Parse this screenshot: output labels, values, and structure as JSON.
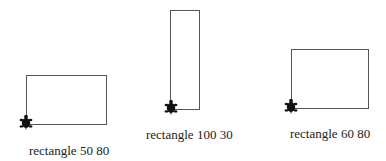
{
  "colors": {
    "line": "#555555",
    "turtle": "#111111",
    "text": "#222222",
    "background": "#ffffff"
  },
  "figures": [
    {
      "label": "rectangle 50 80",
      "height": 50,
      "width": 80,
      "rect": {
        "x": 26,
        "y": 75,
        "w": 80,
        "h": 49
      },
      "turtle": {
        "x": 26,
        "y": 124
      },
      "label_pos": {
        "x": 29,
        "y": 144
      }
    },
    {
      "label": "rectangle 100 30",
      "height": 100,
      "width": 30,
      "rect": {
        "x": 170,
        "y": 10,
        "w": 29,
        "h": 99
      },
      "turtle": {
        "x": 171,
        "y": 109
      },
      "label_pos": {
        "x": 146,
        "y": 128
      }
    },
    {
      "label": "rectangle 60 80",
      "height": 60,
      "width": 80,
      "rect": {
        "x": 291,
        "y": 49,
        "w": 77,
        "h": 59
      },
      "turtle": {
        "x": 291,
        "y": 108
      },
      "label_pos": {
        "x": 290,
        "y": 127
      }
    }
  ]
}
